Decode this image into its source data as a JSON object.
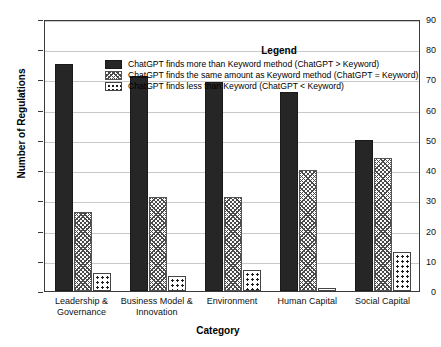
{
  "chart_data": {
    "type": "bar",
    "title": "",
    "xlabel": "Category",
    "ylabel": "Number of Regulations",
    "ylim": [
      0,
      90
    ],
    "yticks": [
      0,
      10,
      20,
      30,
      40,
      50,
      60,
      70,
      80,
      90
    ],
    "grid": true,
    "legend_position": "top-center",
    "legend_title": "Legend",
    "categories": [
      "Leadership & Governance",
      "Business Model & Innovation",
      "Environment",
      "Human Capital",
      "Social Capital"
    ],
    "series": [
      {
        "name": "ChatGPT finds more than Keyword method (ChatGPT > Keyword)",
        "pattern": "solid",
        "values": [
          75,
          71,
          69,
          66,
          50
        ]
      },
      {
        "name": "ChatGPT finds the same amount as Keyword method (ChatGPT = Keyword)",
        "pattern": "hatch",
        "values": [
          26,
          31,
          31,
          40,
          44
        ]
      },
      {
        "name": "ChatGPT finds less than Keyword (ChatGPT < Keyword)",
        "pattern": "dots",
        "values": [
          6,
          5,
          7,
          1,
          13
        ]
      }
    ]
  },
  "axis": {
    "y_title": "Number of Regulations",
    "x_title": "Category",
    "y_tick_labels": [
      "0",
      "10",
      "20",
      "30",
      "40",
      "50",
      "60",
      "70",
      "80",
      "90"
    ],
    "x_tick_labels": [
      "Leadership &\nGovernance",
      "Business Model &\nInnovation",
      "Environment",
      "Human Capital",
      "Social Capital"
    ]
  },
  "legend": {
    "title": "Legend",
    "entries": [
      {
        "pattern": "solid",
        "label": "ChatGPT finds more than Keyword method (ChatGPT > Keyword)"
      },
      {
        "pattern": "hatch",
        "label": "ChatGPT finds the same amount as Keyword method (ChatGPT = Keyword)"
      },
      {
        "pattern": "dots",
        "label": "ChatGPT finds less than Keyword (ChatGPT < Keyword)"
      }
    ]
  },
  "colors": {
    "solid": "#262626",
    "grid": "#c9c9c9",
    "frame": "#3a3a3a",
    "background": "#ffffff"
  }
}
